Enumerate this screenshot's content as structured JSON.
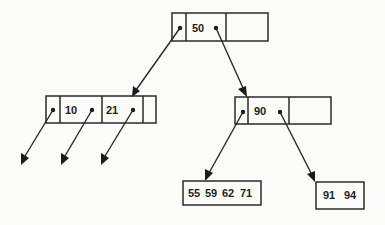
{
  "colors": {
    "ink": "#2a2a2a",
    "background": "#fbfbf8"
  },
  "nodes": {
    "root": {
      "keys": [
        "50"
      ]
    },
    "left": {
      "keys": [
        "10",
        "21"
      ]
    },
    "right": {
      "keys": [
        "90"
      ]
    },
    "leaf_left": {
      "keys": [
        "55",
        "59",
        "62",
        "71"
      ]
    },
    "leaf_right": {
      "keys": [
        "91",
        "94"
      ]
    }
  },
  "edges": [
    {
      "from": "root.p0",
      "to": "left"
    },
    {
      "from": "root.p1",
      "to": "right"
    },
    {
      "from": "left.p0",
      "to": "subtree"
    },
    {
      "from": "left.p1",
      "to": "subtree"
    },
    {
      "from": "left.p2",
      "to": "subtree"
    },
    {
      "from": "right.p0",
      "to": "leaf_left"
    },
    {
      "from": "right.p1",
      "to": "leaf_right"
    }
  ]
}
